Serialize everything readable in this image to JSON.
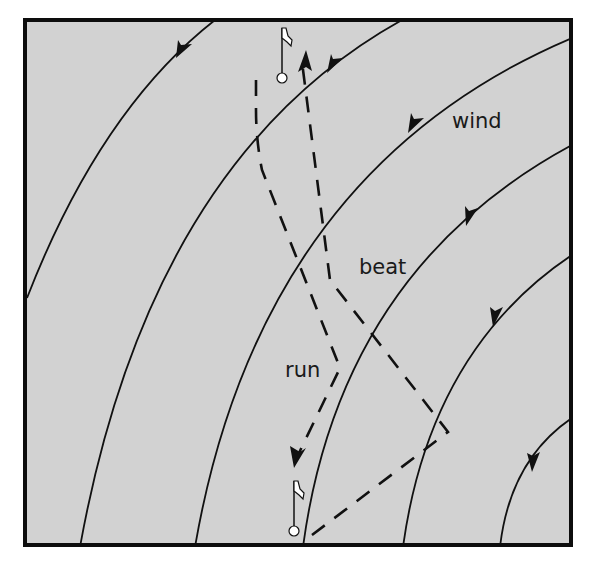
{
  "diagram": {
    "labels": {
      "wind": "wind",
      "beat": "beat",
      "run": "run"
    },
    "colors": {
      "background": "#d2d2d2",
      "line": "#111111",
      "frame": "#0d0d0d",
      "page": "#ffffff"
    },
    "marks": [
      {
        "name": "top-mark",
        "x": 282,
        "y": 77
      },
      {
        "name": "bottom-mark",
        "x": 294,
        "y": 531
      }
    ],
    "wind_arcs": 6,
    "legs": [
      "beat",
      "run"
    ]
  }
}
